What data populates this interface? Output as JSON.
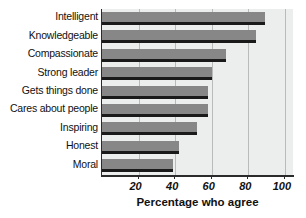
{
  "chart_data": {
    "type": "bar",
    "orientation": "horizontal",
    "title": "",
    "xlabel": "Percentage who agree",
    "ylabel": "",
    "categories": [
      "Intelligent",
      "Knowledgeable",
      "Compassionate",
      "Strong leader",
      "Gets things done",
      "Cares about people",
      "Inspiring",
      "Honest",
      "Moral"
    ],
    "values": [
      89,
      84,
      68,
      60,
      58,
      58,
      52,
      42,
      39
    ],
    "xlim": [
      0,
      105
    ],
    "xticks": [
      20,
      40,
      60,
      80,
      100
    ],
    "xtick_labels": [
      "20",
      "40",
      "60",
      "80",
      "100"
    ],
    "grid": "vertical",
    "legend": "none",
    "colors": {
      "bar_fill": "#878787",
      "bar_shadow": "#1a1a1a",
      "plot_background": "#eceded",
      "gridline": "#b9bbbb",
      "axis": "#2b2b2b",
      "text": "#111111",
      "page_background": "#ffffff"
    }
  }
}
